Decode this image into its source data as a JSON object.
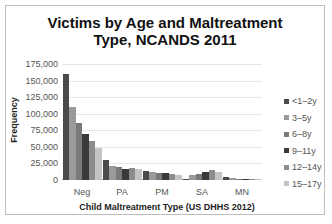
{
  "chart_data": {
    "type": "bar",
    "title": "Victims by Age and Maltreatment Type, NCANDS 2011",
    "title_lines": [
      "Victims by Age and Maltreatment",
      "Type, NCANDS 2011"
    ],
    "xlabel": "Child Maltreatment Type (US DHHS 2012)",
    "ylabel": "Frequency",
    "ylim": [
      0,
      175000
    ],
    "yticks": [
      "0",
      "25,000",
      "50,000",
      "75,000",
      "100,000",
      "125,000",
      "150,000",
      "175,000"
    ],
    "grid": true,
    "legend_position": "right",
    "categories": [
      "Neg",
      "PA",
      "PM",
      "SA",
      "MN"
    ],
    "series": [
      {
        "name": "<1–2y",
        "color": "#4a4a4a",
        "values": [
          160000,
          30000,
          13000,
          1500,
          5000
        ]
      },
      {
        "name": "3–5y",
        "color": "#9a9a9a",
        "values": [
          110000,
          21000,
          12000,
          8000,
          3000
        ]
      },
      {
        "name": "6–8y",
        "color": "#7a7a7a",
        "values": [
          86000,
          20000,
          11000,
          9000,
          2000
        ]
      },
      {
        "name": "9–11y",
        "color": "#3a3a3a",
        "values": [
          69000,
          17000,
          11000,
          12000,
          1500
        ]
      },
      {
        "name": "12–14y",
        "color": "#8c8c8c",
        "values": [
          59000,
          18000,
          9000,
          15000,
          1500
        ]
      },
      {
        "name": "15–17y",
        "color": "#c4c4c4",
        "values": [
          48000,
          16000,
          8000,
          12000,
          1000
        ]
      }
    ]
  }
}
